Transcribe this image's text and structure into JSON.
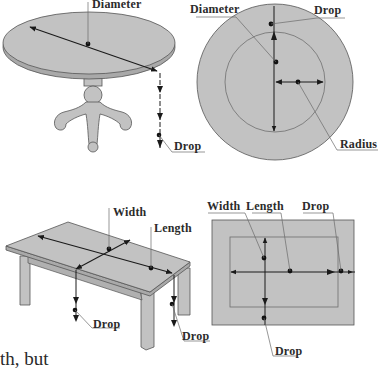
{
  "colors": {
    "surface": "#c2c2c2",
    "surface_edge": "#a9a9a9",
    "outline": "#555555",
    "arrow": "#1a1a1a",
    "leader": "#6a6a6a",
    "text": "#2b2b2b"
  },
  "round_table": {
    "diameter_label": "Diameter",
    "drop_label": "Drop"
  },
  "round_plan": {
    "diameter_label": "Diameter",
    "drop_label": "Drop",
    "radius_label": "Radius"
  },
  "rect_table": {
    "width_label": "Width",
    "length_label": "Length",
    "drop_label_left": "Drop",
    "drop_label_right": "Drop"
  },
  "rect_plan": {
    "width_label": "Width",
    "length_label": "Length",
    "drop_label_top": "Drop",
    "drop_label_bottom": "Drop"
  },
  "body_text": {
    "line1": "th, but"
  }
}
